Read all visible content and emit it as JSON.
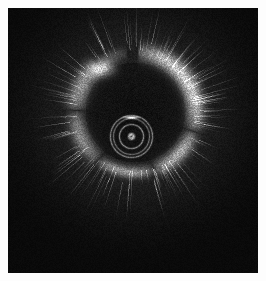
{
  "image": {
    "modality": "intravascular-ultrasound-cross-section",
    "colorspace": "grayscale",
    "frame": {
      "canvas_width": 266,
      "canvas_height": 281,
      "margin_color": "#fdfdfd",
      "scan_left": 8,
      "scan_top": 8,
      "scan_width": 250,
      "scan_height": 265,
      "background_color": "#050505"
    },
    "noise": {
      "type": "speckle",
      "base_level": 7,
      "amplitude": 22,
      "grain_px": 1,
      "radial_falloff": true
    },
    "vessel_wall": {
      "label": "vessel-wall-ring",
      "center_x": 127,
      "center_y": 104,
      "radius": 60,
      "thickness": 11,
      "peak_brightness": 215,
      "arcs": [
        {
          "name": "upper-right-bright-arc",
          "start_deg": -88,
          "end_deg": 18,
          "brightness": 215,
          "thickness": 14
        },
        {
          "name": "right-arc",
          "start_deg": 18,
          "end_deg": 72,
          "brightness": 170,
          "thickness": 12
        },
        {
          "name": "lower-arc",
          "start_deg": 72,
          "end_deg": 128,
          "brightness": 150,
          "thickness": 9
        },
        {
          "name": "lower-left-arc",
          "start_deg": 128,
          "end_deg": 182,
          "brightness": 128,
          "thickness": 13
        },
        {
          "name": "left-arc",
          "start_deg": 182,
          "end_deg": 232,
          "brightness": 142,
          "thickness": 15
        },
        {
          "name": "upper-left-gap",
          "start_deg": 232,
          "end_deg": 262,
          "brightness": 58,
          "thickness": 10
        }
      ]
    },
    "plaque_spot": {
      "label": "upper-left-plaque",
      "center_x": 93,
      "center_y": 60,
      "radius_x": 13,
      "radius_y": 9,
      "brightness": 205
    },
    "radial_streaks": {
      "label": "radial-speckle-streaks",
      "count": 160,
      "inner_radius": 58,
      "outer_radius": 108,
      "brightness": 46
    },
    "catheter": {
      "label": "catheter-core",
      "center_x": 123,
      "center_y": 128,
      "rings": [
        {
          "name": "outer-ring",
          "radius": 21,
          "brightness": 118,
          "width": 1
        },
        {
          "name": "mid-ring",
          "radius": 18,
          "brightness": 96,
          "width": 1
        },
        {
          "name": "inner-ring",
          "radius": 12,
          "brightness": 128,
          "width": 1
        },
        {
          "name": "core-dot",
          "radius": 2,
          "brightness": 190,
          "width": 2
        }
      ]
    },
    "guidewire_artifact": {
      "label": "guidewire-streak",
      "center_x": 123,
      "center_y": 109,
      "half_width": 7,
      "half_height": 1,
      "brightness": 235
    },
    "lumen": {
      "label": "vessel-lumen",
      "center_x": 127,
      "center_y": 104,
      "radius": 50,
      "brightness": 12
    }
  }
}
